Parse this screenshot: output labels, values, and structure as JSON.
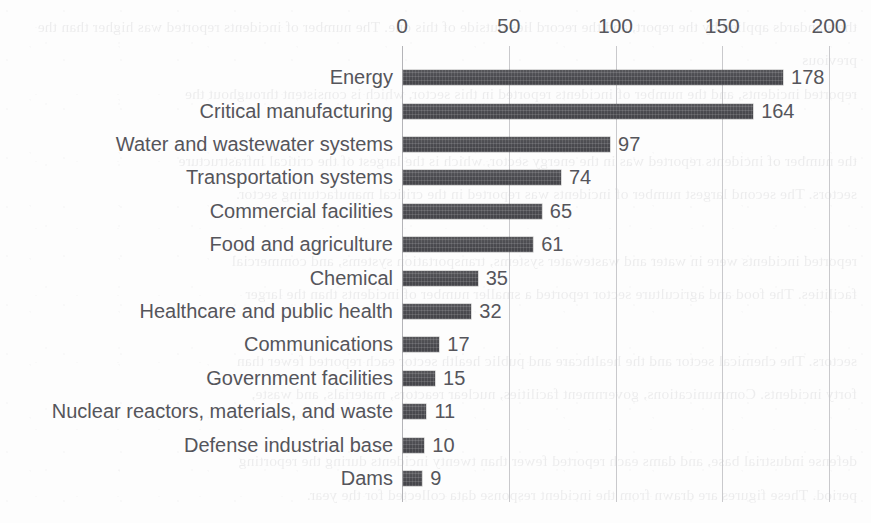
{
  "figure": {
    "name": "critical-infrastructure-incidents-bar-chart",
    "bar_color": "#4b4b50",
    "text_color": "#55555b",
    "gridline_color": "#c9c9cc",
    "background_color": "#fdfdfd"
  },
  "bleed_text": "the standards applied by the report, and the record lies outside of this one. The number of incidents reported was higher than the previous\nreported incidents, and the number of incidents reported in this sector, which is consistent throughout the\n\nthe number of incidents reported was in the energy sector, which is the largest of the critical infrastructure\nsectors. The second largest number of incidents was reported in the critical manufacturing sector.\n\nreported incidents were in water and wastewater systems, transportation systems, and commercial\nfacilities. The food and agriculture sector reported a smaller number of incidents than the larger\n\nsectors. The chemical sector and the healthcare and public health sector each reported fewer than\nforty incidents. Communications, government facilities, nuclear reactors, materials, and waste,\n\ndefense industrial base, and dams each reported fewer than twenty incidents during the reporting\nperiod. These figures are drawn from the incident response data collected for the year.",
  "chart_data": {
    "type": "bar",
    "orientation": "horizontal",
    "title": "",
    "subtitle": "",
    "xlabel": "",
    "ylabel": "",
    "xlim": [
      0,
      200
    ],
    "ylim": null,
    "grid": true,
    "grid_axis": "x",
    "legend": false,
    "legend_position": "none",
    "axis_position": "top",
    "value_labels": true,
    "sorted": "descending",
    "ticks": [
      {
        "value": 0,
        "label": "0"
      },
      {
        "value": 50,
        "label": "50"
      },
      {
        "value": 100,
        "label": "100"
      },
      {
        "value": 150,
        "label": "150"
      },
      {
        "value": 200,
        "label": "200"
      }
    ],
    "categories": [
      "Energy",
      "Critical manufacturing",
      "Water and wastewater systems",
      "Transportation systems",
      "Commercial facilities",
      "Food and agriculture",
      "Chemical",
      "Healthcare and public health",
      "Communications",
      "Government facilities",
      "Nuclear reactors, materials, and waste",
      "Defense industrial base",
      "Dams"
    ],
    "values": [
      178,
      164,
      97,
      74,
      65,
      61,
      35,
      32,
      17,
      15,
      11,
      10,
      9
    ],
    "value_label_text": [
      "178",
      "164",
      "97",
      "74",
      "65",
      "61",
      "35",
      "32",
      "17",
      "15",
      "11",
      "10",
      "9"
    ],
    "series": [
      {
        "name": "Incidents",
        "color": "#4b4b50",
        "values": [
          178,
          164,
          97,
          74,
          65,
          61,
          35,
          32,
          17,
          15,
          11,
          10,
          9
        ]
      }
    ],
    "rows": [
      {
        "label": "Energy",
        "value": 178,
        "value_text": "178"
      },
      {
        "label": "Critical manufacturing",
        "value": 164,
        "value_text": "164"
      },
      {
        "label": "Water and wastewater systems",
        "value": 97,
        "value_text": "97"
      },
      {
        "label": "Transportation systems",
        "value": 74,
        "value_text": "74"
      },
      {
        "label": "Commercial facilities",
        "value": 65,
        "value_text": "65"
      },
      {
        "label": "Food and agriculture",
        "value": 61,
        "value_text": "61"
      },
      {
        "label": "Chemical",
        "value": 35,
        "value_text": "35"
      },
      {
        "label": "Healthcare and public health",
        "value": 32,
        "value_text": "32"
      },
      {
        "label": "Communications",
        "value": 17,
        "value_text": "17"
      },
      {
        "label": "Government facilities",
        "value": 15,
        "value_text": "15"
      },
      {
        "label": "Nuclear reactors, materials, and waste",
        "value": 11,
        "value_text": "11"
      },
      {
        "label": "Defense industrial base",
        "value": 10,
        "value_text": "10"
      },
      {
        "label": "Dams",
        "value": 9,
        "value_text": "9"
      }
    ]
  }
}
